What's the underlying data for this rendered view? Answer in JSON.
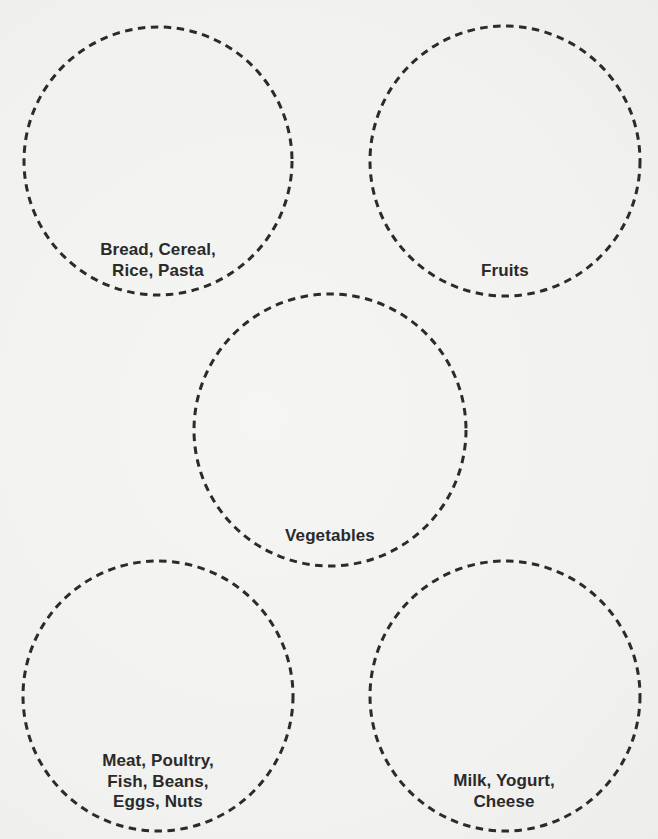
{
  "worksheet": {
    "groups": [
      {
        "id": "grains",
        "label_lines": [
          "Bread, Cereal,",
          "Rice, Pasta"
        ],
        "circle": {
          "cx": 158,
          "cy": 161,
          "r": 134
        }
      },
      {
        "id": "fruits",
        "label_lines": [
          "Fruits"
        ],
        "circle": {
          "cx": 505,
          "cy": 161,
          "r": 135
        }
      },
      {
        "id": "vegetables",
        "label_lines": [
          "Vegetables"
        ],
        "circle": {
          "cx": 330,
          "cy": 430,
          "r": 136
        }
      },
      {
        "id": "protein",
        "label_lines": [
          "Meat, Poultry,",
          "Fish, Beans,",
          "Eggs, Nuts"
        ],
        "circle": {
          "cx": 158,
          "cy": 696,
          "r": 135
        }
      },
      {
        "id": "dairy",
        "label_lines": [
          "Milk, Yogurt,",
          "Cheese"
        ],
        "circle": {
          "cx": 505,
          "cy": 696,
          "r": 135
        }
      }
    ]
  },
  "colors": {
    "paper": "#f2f2f0",
    "ink": "#2a2a2a"
  }
}
